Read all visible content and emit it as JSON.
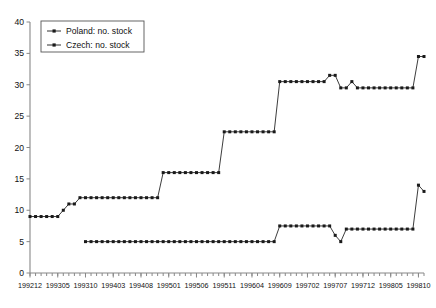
{
  "chart_data": {
    "type": "line",
    "title": "",
    "xlabel": "",
    "ylabel": "",
    "ylim": [
      0,
      40
    ],
    "ytick_step": 5,
    "yticks": [
      0,
      5,
      10,
      15,
      20,
      25,
      30,
      35,
      40
    ],
    "grid": false,
    "legend_position": "top-left",
    "marker": "filled-square",
    "line_color": "#1a1a1a",
    "x": [
      "199212",
      "199301",
      "199302",
      "199303",
      "199304",
      "199305",
      "199306",
      "199307",
      "199308",
      "199309",
      "199310",
      "199311",
      "199312",
      "199401",
      "199402",
      "199403",
      "199404",
      "199405",
      "199406",
      "199407",
      "199408",
      "199409",
      "199410",
      "199411",
      "199412",
      "199501",
      "199502",
      "199503",
      "199504",
      "199505",
      "199506",
      "199507",
      "199508",
      "199509",
      "199510",
      "199511",
      "199512",
      "199601",
      "199602",
      "199603",
      "199604",
      "199605",
      "199606",
      "199607",
      "199608",
      "199609",
      "199610",
      "199611",
      "199612",
      "199701",
      "199702",
      "199703",
      "199704",
      "199705",
      "199706",
      "199707",
      "199708",
      "199709",
      "199710",
      "199711",
      "199712",
      "199801",
      "199802",
      "199803",
      "199804",
      "199805",
      "199806",
      "199807",
      "199808",
      "199809",
      "199810",
      "199811"
    ],
    "xtick_labels": [
      "199212",
      "199305",
      "199310",
      "199403",
      "199408",
      "199501",
      "199506",
      "199511",
      "199604",
      "199609",
      "199702",
      "199707",
      "199712",
      "199805",
      "199810"
    ],
    "xtick_indices": [
      0,
      5,
      10,
      15,
      20,
      25,
      30,
      35,
      40,
      45,
      50,
      55,
      60,
      65,
      70
    ],
    "series": [
      {
        "name": "Poland: no. stock",
        "values": [
          9,
          9,
          9,
          9,
          9,
          9,
          10,
          11,
          11,
          12,
          12,
          12,
          12,
          12,
          12,
          12,
          12,
          12,
          12,
          12,
          12,
          12,
          12,
          12,
          16,
          16,
          16,
          16,
          16,
          16,
          16,
          16,
          16,
          16,
          16,
          22.5,
          22.5,
          22.5,
          22.5,
          22.5,
          22.5,
          22.5,
          22.5,
          22.5,
          22.5,
          30.5,
          30.5,
          30.5,
          30.5,
          30.5,
          30.5,
          30.5,
          30.5,
          30.5,
          31.5,
          31.5,
          29.5,
          29.5,
          30.5,
          29.5,
          29.5,
          29.5,
          29.5,
          29.5,
          29.5,
          29.5,
          29.5,
          29.5,
          29.5,
          29.5,
          34.5,
          34.5
        ]
      },
      {
        "name": "Czech: no. stock",
        "values": [
          null,
          null,
          null,
          null,
          null,
          null,
          null,
          null,
          null,
          null,
          5,
          5,
          5,
          5,
          5,
          5,
          5,
          5,
          5,
          5,
          5,
          5,
          5,
          5,
          5,
          5,
          5,
          5,
          5,
          5,
          5,
          5,
          5,
          5,
          5,
          5,
          5,
          5,
          5,
          5,
          5,
          5,
          5,
          5,
          5,
          7.5,
          7.5,
          7.5,
          7.5,
          7.5,
          7.5,
          7.5,
          7.5,
          7.5,
          7.5,
          6,
          5,
          7,
          7,
          7,
          7,
          7,
          7,
          7,
          7,
          7,
          7,
          7,
          7,
          7,
          14,
          13
        ]
      }
    ]
  },
  "legend": {
    "entries": [
      {
        "label": "Poland: no. stock"
      },
      {
        "label": "Czech: no. stock"
      }
    ]
  }
}
